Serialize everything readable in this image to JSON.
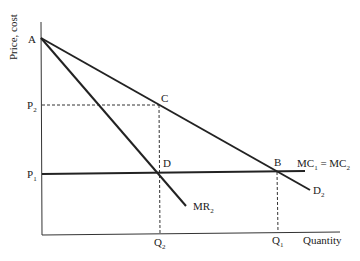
{
  "diagram": {
    "y_axis_label": "Price, cost",
    "x_axis_label": "Quantity",
    "points": {
      "A": "A",
      "B": "B",
      "C": "C",
      "D": "D"
    },
    "price_labels": {
      "p2": {
        "main": "P",
        "sub": "2"
      },
      "p1": {
        "main": "P",
        "sub": "1"
      }
    },
    "quantity_labels": {
      "q2": {
        "main": "Q",
        "sub": "2"
      },
      "q1": {
        "main": "Q",
        "sub": "1"
      }
    },
    "curves": {
      "mc": {
        "part1": "MC",
        "sub1": "1",
        "eq": " = MC",
        "sub2": "2"
      },
      "demand": {
        "main": "D",
        "sub": "2"
      },
      "mr": {
        "main": "MR",
        "sub": "2"
      }
    }
  }
}
